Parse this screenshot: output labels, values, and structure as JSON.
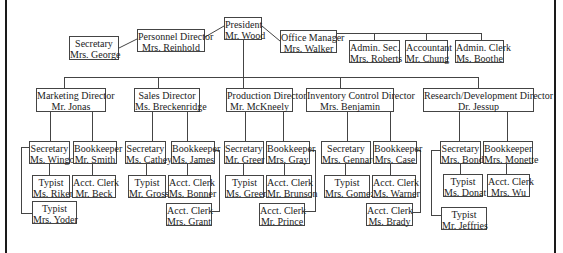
{
  "diagram": {
    "type": "org-chart",
    "colors": {
      "line": "#444444",
      "border": "#444444",
      "text": "#222222",
      "background": "#ffffff",
      "frame": "#1a1a1a"
    },
    "nodes": [
      {
        "id": "president",
        "title": "President",
        "name": "Mr. Wood",
        "x": 224,
        "y": 17,
        "w": 38,
        "h": 23
      },
      {
        "id": "personnel-director",
        "title": "Personnel Director",
        "name": "Mrs. Reinhold",
        "x": 137,
        "y": 29,
        "w": 68,
        "h": 23
      },
      {
        "id": "secretary-george",
        "title": "Secretary",
        "name": "Mrs. George",
        "x": 69,
        "y": 36,
        "w": 50,
        "h": 24
      },
      {
        "id": "office-manager",
        "title": "Office Manager",
        "name": "Mrs. Walker",
        "x": 280,
        "y": 30,
        "w": 57,
        "h": 23
      },
      {
        "id": "admin-sec-roberts",
        "title": "Admin. Sec.",
        "name": "Mrs. Roberts",
        "x": 349,
        "y": 40,
        "w": 51,
        "h": 23
      },
      {
        "id": "accountant-chung",
        "title": "Accountant",
        "name": "Mr. Chung",
        "x": 405,
        "y": 40,
        "w": 43,
        "h": 23
      },
      {
        "id": "admin-clerk-boothe",
        "title": "Admin. Clerk",
        "name": "Ms. Boothe",
        "x": 455,
        "y": 40,
        "w": 49,
        "h": 23
      },
      {
        "id": "marketing-director",
        "title": "Marketing Director",
        "name": "Mr. Jonas",
        "x": 36,
        "y": 88,
        "w": 70,
        "h": 24
      },
      {
        "id": "sales-director",
        "title": "Sales Director",
        "name": "Ms. Breckenridge",
        "x": 134,
        "y": 88,
        "w": 66,
        "h": 24
      },
      {
        "id": "production-director",
        "title": "Production Director",
        "name": "Mr. McKneely",
        "x": 226,
        "y": 88,
        "w": 67,
        "h": 24
      },
      {
        "id": "inventory-director",
        "title": "Inventory Control Director",
        "name": "Mrs. Benjamin",
        "x": 306,
        "y": 88,
        "w": 88,
        "h": 24
      },
      {
        "id": "rd-director",
        "title": "Research/Development Director",
        "name": "Dr. Jessup",
        "x": 423,
        "y": 88,
        "w": 111,
        "h": 24
      },
      {
        "id": "secretary-wingo",
        "title": "Secretary",
        "name": "Ms. Wingo",
        "x": 29,
        "y": 141,
        "w": 41,
        "h": 23
      },
      {
        "id": "bookkeeper-smith",
        "title": "Bookkeeper",
        "name": "Mr. Smith",
        "x": 73,
        "y": 141,
        "w": 44,
        "h": 23
      },
      {
        "id": "typist-riker",
        "title": "Typist",
        "name": "Ms. Riker",
        "x": 32,
        "y": 175,
        "w": 38,
        "h": 23
      },
      {
        "id": "acct-clerk-beck",
        "title": "Acct. Clerk",
        "name": "Mr. Beck",
        "x": 72,
        "y": 175,
        "w": 44,
        "h": 23
      },
      {
        "id": "typist-yoder",
        "title": "Typist",
        "name": "Mrs. Yoder",
        "x": 32,
        "y": 201,
        "w": 45,
        "h": 23
      },
      {
        "id": "secretary-cathey",
        "title": "Secretary",
        "name": "Ms. Cathey",
        "x": 125,
        "y": 141,
        "w": 41,
        "h": 23
      },
      {
        "id": "bookkeeper-james",
        "title": "Bookkeeper",
        "name": "Ms. James",
        "x": 171,
        "y": 141,
        "w": 44,
        "h": 23
      },
      {
        "id": "typist-gross",
        "title": "Typist",
        "name": "Mr. Gross",
        "x": 128,
        "y": 175,
        "w": 38,
        "h": 23
      },
      {
        "id": "acct-clerk-bonner",
        "title": "Acct. Clerk",
        "name": "Ms. Bonner",
        "x": 168,
        "y": 175,
        "w": 43,
        "h": 23
      },
      {
        "id": "acct-clerk-grant",
        "title": "Acct. Clerk",
        "name": "Mrs. Grant",
        "x": 166,
        "y": 203,
        "w": 46,
        "h": 23
      },
      {
        "id": "secretary-greer",
        "title": "Secretary",
        "name": "Mr. Greer",
        "x": 224,
        "y": 141,
        "w": 40,
        "h": 23
      },
      {
        "id": "bookkeeper-gray",
        "title": "Bookkeeper",
        "name": "Mrs. Gray",
        "x": 266,
        "y": 141,
        "w": 44,
        "h": 23
      },
      {
        "id": "typist-green",
        "title": "Typist",
        "name": "Ms. Green",
        "x": 225,
        "y": 175,
        "w": 39,
        "h": 23
      },
      {
        "id": "acct-clerk-brunson",
        "title": "Acct. Clerk",
        "name": "Mr. Brunson",
        "x": 266,
        "y": 175,
        "w": 46,
        "h": 23
      },
      {
        "id": "acct-clerk-prince",
        "title": "Acct. Clerk",
        "name": "Mr. Prince",
        "x": 259,
        "y": 203,
        "w": 46,
        "h": 23
      },
      {
        "id": "secretary-gennaro",
        "title": "Secretary",
        "name": "Mrs. Gennaro",
        "x": 321,
        "y": 141,
        "w": 50,
        "h": 23
      },
      {
        "id": "bookkeeper-case",
        "title": "Bookkeeper",
        "name": "Mrs. Case",
        "x": 373,
        "y": 141,
        "w": 44,
        "h": 23
      },
      {
        "id": "typist-gomez",
        "title": "Typist",
        "name": "Mrs. Gomez",
        "x": 324,
        "y": 175,
        "w": 46,
        "h": 23
      },
      {
        "id": "acct-clerk-warner",
        "title": "Acct. Clerk",
        "name": "Ms. Warner",
        "x": 372,
        "y": 175,
        "w": 44,
        "h": 23
      },
      {
        "id": "acct-clerk-brady",
        "title": "Acct. Clerk",
        "name": "Ms. Brady",
        "x": 366,
        "y": 203,
        "w": 47,
        "h": 23
      },
      {
        "id": "secretary-bond",
        "title": "Secretary",
        "name": "Mrs. Bond",
        "x": 440,
        "y": 141,
        "w": 41,
        "h": 23
      },
      {
        "id": "bookkeeper-monette",
        "title": "Bookkeeper",
        "name": "Mrs. Monette",
        "x": 483,
        "y": 141,
        "w": 50,
        "h": 23
      },
      {
        "id": "typist-donat",
        "title": "Typist",
        "name": "Ms. Donat",
        "x": 443,
        "y": 174,
        "w": 40,
        "h": 23
      },
      {
        "id": "acct-clerk-wu",
        "title": "Acct. Clerk",
        "name": "Mrs. Wu",
        "x": 487,
        "y": 174,
        "w": 43,
        "h": 23
      },
      {
        "id": "typist-jeffries",
        "title": "Typist",
        "name": "Mr. Jeffries",
        "x": 441,
        "y": 207,
        "w": 46,
        "h": 23
      }
    ],
    "edges": [
      {
        "from": "president",
        "to": "personnel-director"
      },
      {
        "from": "personnel-director",
        "to": "secretary-george"
      },
      {
        "from": "president",
        "to": "office-manager"
      },
      {
        "from": "office-manager",
        "to": "admin-sec-roberts"
      },
      {
        "from": "office-manager",
        "to": "accountant-chung"
      },
      {
        "from": "office-manager",
        "to": "admin-clerk-boothe"
      },
      {
        "from": "president",
        "to": "marketing-director"
      },
      {
        "from": "president",
        "to": "sales-director"
      },
      {
        "from": "president",
        "to": "production-director"
      },
      {
        "from": "president",
        "to": "inventory-director"
      },
      {
        "from": "president",
        "to": "rd-director"
      },
      {
        "from": "marketing-director",
        "to": "secretary-wingo"
      },
      {
        "from": "marketing-director",
        "to": "bookkeeper-smith"
      },
      {
        "from": "secretary-wingo",
        "to": "typist-riker"
      },
      {
        "from": "secretary-wingo",
        "to": "typist-yoder"
      },
      {
        "from": "bookkeeper-smith",
        "to": "acct-clerk-beck"
      },
      {
        "from": "sales-director",
        "to": "secretary-cathey"
      },
      {
        "from": "sales-director",
        "to": "bookkeeper-james"
      },
      {
        "from": "secretary-cathey",
        "to": "typist-gross"
      },
      {
        "from": "bookkeeper-james",
        "to": "acct-clerk-bonner"
      },
      {
        "from": "bookkeeper-james",
        "to": "acct-clerk-grant"
      },
      {
        "from": "production-director",
        "to": "secretary-greer"
      },
      {
        "from": "production-director",
        "to": "bookkeeper-gray"
      },
      {
        "from": "secretary-greer",
        "to": "typist-green"
      },
      {
        "from": "bookkeeper-gray",
        "to": "acct-clerk-brunson"
      },
      {
        "from": "bookkeeper-gray",
        "to": "acct-clerk-prince"
      },
      {
        "from": "inventory-director",
        "to": "secretary-gennaro"
      },
      {
        "from": "inventory-director",
        "to": "bookkeeper-case"
      },
      {
        "from": "secretary-gennaro",
        "to": "typist-gomez"
      },
      {
        "from": "bookkeeper-case",
        "to": "acct-clerk-warner"
      },
      {
        "from": "bookkeeper-case",
        "to": "acct-clerk-brady"
      },
      {
        "from": "rd-director",
        "to": "secretary-bond"
      },
      {
        "from": "rd-director",
        "to": "bookkeeper-monette"
      },
      {
        "from": "secretary-bond",
        "to": "typist-donat"
      },
      {
        "from": "secretary-bond",
        "to": "typist-jeffries"
      },
      {
        "from": "bookkeeper-monette",
        "to": "acct-clerk-wu"
      }
    ]
  }
}
